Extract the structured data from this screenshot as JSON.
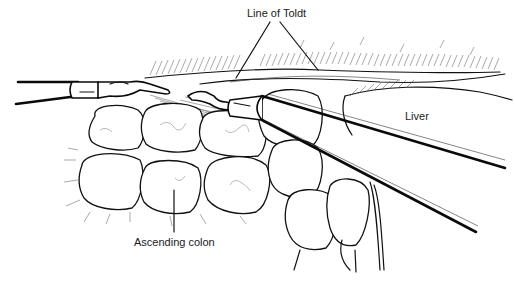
{
  "figure": {
    "labels": {
      "line_of_toldt": "Line of Toldt",
      "liver": "Liver",
      "ascending_colon": "Ascending colon"
    },
    "caption_faint": ""
  }
}
